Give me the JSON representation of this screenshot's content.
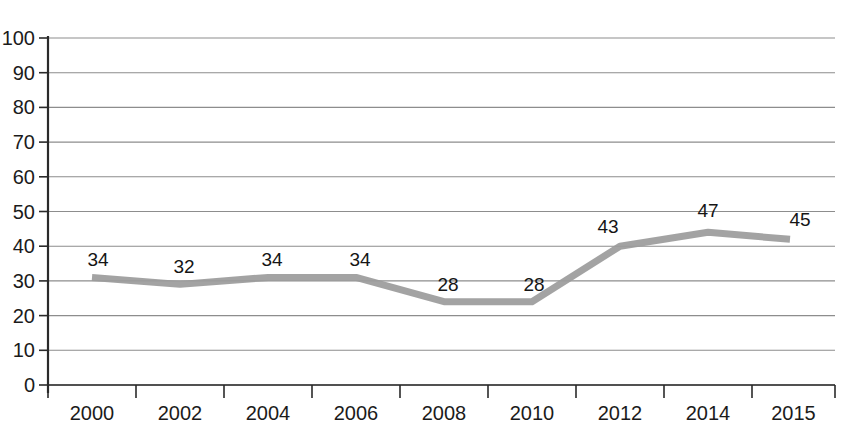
{
  "chart_data": {
    "type": "line",
    "title": "",
    "subtitle": "",
    "xlabel": "",
    "ylabel": "",
    "categories": [
      "2000",
      "2002",
      "2004",
      "2006",
      "2008",
      "2010",
      "2012",
      "2014",
      "2015"
    ],
    "values": [
      34,
      32,
      34,
      34,
      28,
      28,
      43,
      47,
      45
    ],
    "point_labels": [
      "34",
      "32",
      "34",
      "34",
      "28",
      "28",
      "43",
      "47",
      "45"
    ],
    "series": [
      {
        "name": "",
        "values": [
          34,
          32,
          34,
          34,
          28,
          28,
          43,
          47,
          45
        ],
        "color": "#9b9b9b"
      }
    ],
    "ylim": [
      0,
      100
    ],
    "ytick_values": [
      0,
      10,
      20,
      30,
      40,
      50,
      60,
      70,
      80,
      90,
      100
    ],
    "ytick_labels": [
      "0",
      "10",
      "20",
      "30",
      "40",
      "50",
      "60",
      "70",
      "80",
      "90",
      "100"
    ],
    "xtick_labels": [
      "2000",
      "2002",
      "2004",
      "2006",
      "2008",
      "2010",
      "2012",
      "2014",
      "2015"
    ],
    "grid": true,
    "grid_axis": "horizontal",
    "legend": false,
    "legend_position": "none",
    "annotations": [],
    "colors": {
      "line": "#9b9b9b",
      "grid": "#8d8d8d",
      "axis": "#2a2a2a",
      "text": "#1b1b1b",
      "background": "#ffffff"
    },
    "plotted_pixel_values": [
      31,
      29,
      31,
      31,
      24,
      24,
      40,
      44,
      42
    ]
  },
  "geometry": {
    "plot_left": 48,
    "plot_right": 835,
    "y_zero": 385,
    "y_top": 38,
    "x_positions": [
      92,
      180,
      268,
      356,
      444,
      532,
      620,
      708,
      790
    ],
    "tick_positions": [
      48,
      136,
      224,
      312,
      400,
      488,
      576,
      664,
      752,
      835
    ],
    "label_offsets": [
      {
        "dx": 6,
        "dy": -18
      },
      {
        "dx": 4,
        "dy": -18
      },
      {
        "dx": 4,
        "dy": -18
      },
      {
        "dx": 4,
        "dy": -18
      },
      {
        "dx": 4,
        "dy": -18
      },
      {
        "dx": 2,
        "dy": -18
      },
      {
        "dx": -12,
        "dy": -20
      },
      {
        "dx": 0,
        "dy": -22
      },
      {
        "dx": 10,
        "dy": -20
      }
    ]
  }
}
